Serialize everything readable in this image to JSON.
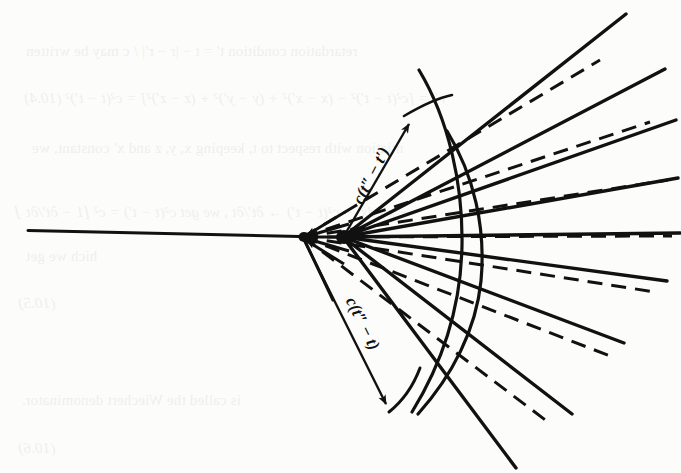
{
  "figure": {
    "kind": "retarded-potential-wavefront-diagram",
    "background_color": "#fcfcfa",
    "ink_color": "#111111",
    "labels": {
      "upper_arrow": "c(t″ − t′)",
      "lower_arrow": "c(t″ − t)"
    },
    "vertices": {
      "left_vertex_label": "dashed-ray-convergence-point",
      "right_vertex_label": "solid-ray-origin-point"
    },
    "arcs": {
      "inner_arc_label": "inner-wavefront-arc",
      "outer_arc_label": "outer-wavefront-arc"
    },
    "axis": {
      "horizontal_line_label": "horizontal-baseline"
    }
  },
  "showthrough": {
    "note": "faint mirror-image text bleeding through from the reverse side of the printed page",
    "lines": [
      {
        "text": "retardation condition  t′ = t − |r − r′| / c  may be written",
        "x": 26,
        "y": 43,
        "size": 15,
        "italic": false
      },
      {
        "text": "r″ = [c²(t − t′)² − (x − x′)² + (y − y′)² + (z − z′)²] = c²(t − t′)²      (10.4)",
        "x": 24,
        "y": 90,
        "size": 15,
        "italic": true
      },
      {
        "text": "ntiation with respect to t, keeping x, y, z and x′ constant, we",
        "x": 32,
        "y": 140,
        "size": 15,
        "italic": false
      },
      {
        "text": "− x′) dx′ − c²(t − t′) → ∂t′/∂t , we get  c²(t − t′) = c² ⌊1 − ∂t′/∂t ⌋",
        "x": 16,
        "y": 203,
        "size": 15,
        "italic": true
      },
      {
        "text": "hich we get",
        "x": 26,
        "y": 248,
        "size": 15,
        "italic": false
      },
      {
        "text": "(10.5)",
        "x": 18,
        "y": 295,
        "size": 15,
        "italic": true
      },
      {
        "text": "is called the Wiechert denominator.",
        "x": 22,
        "y": 392,
        "size": 15,
        "italic": false
      },
      {
        "text": "(10.6)",
        "x": 18,
        "y": 440,
        "size": 15,
        "italic": true
      }
    ]
  },
  "geometry": {
    "solid_rays": [
      {
        "name": "solid-ray-1",
        "x2": 626,
        "y2": 14
      },
      {
        "name": "solid-ray-2",
        "x2": 665,
        "y2": 69
      },
      {
        "name": "solid-ray-3",
        "x2": 676,
        "y2": 120
      },
      {
        "name": "solid-ray-4",
        "x2": 678,
        "y2": 178
      },
      {
        "name": "solid-ray-5",
        "x2": 680,
        "y2": 233
      },
      {
        "name": "solid-ray-6",
        "x2": 667,
        "y2": 281
      },
      {
        "name": "solid-ray-7",
        "x2": 624,
        "y2": 343
      },
      {
        "name": "solid-ray-8",
        "x2": 572,
        "y2": 414
      },
      {
        "name": "solid-ray-9",
        "x2": 516,
        "y2": 468
      }
    ],
    "dashed_rays": [
      {
        "name": "dashed-ray-1",
        "x2": 600,
        "y2": 60
      },
      {
        "name": "dashed-ray-2",
        "x2": 650,
        "y2": 122
      },
      {
        "name": "dashed-ray-3",
        "x2": 668,
        "y2": 180
      },
      {
        "name": "dashed-ray-4",
        "x2": 672,
        "y2": 236
      },
      {
        "name": "dashed-ray-5",
        "x2": 655,
        "y2": 292
      },
      {
        "name": "dashed-ray-6",
        "x2": 610,
        "y2": 356
      },
      {
        "name": "dashed-ray-7",
        "x2": 548,
        "y2": 422
      }
    ]
  }
}
